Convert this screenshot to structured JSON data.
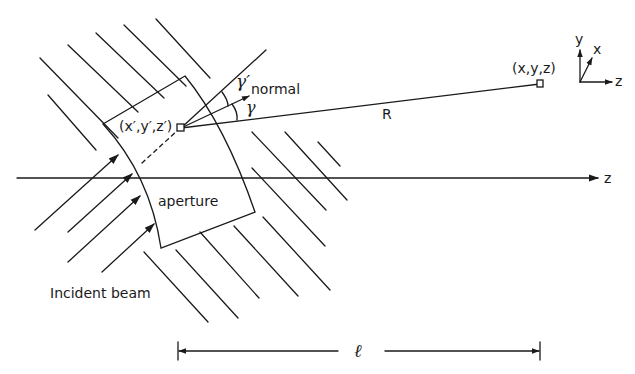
{
  "diagram": {
    "type": "optics-aperture-diffraction-geometry",
    "labels": {
      "source_point": "(x′,y′,z′)",
      "observation_point": "(x,y,z)",
      "distance": "R",
      "normal": "normal",
      "gamma_prime": "γ′",
      "gamma": "γ",
      "aperture": "aperture",
      "incident_beam": "Incident beam",
      "z_axis": "z",
      "separation": "ℓ"
    },
    "axes_triad": {
      "y": "y",
      "x": "x",
      "z": "z"
    },
    "colors": {
      "ink": "#1a1a1a",
      "background": "#ffffff"
    }
  }
}
